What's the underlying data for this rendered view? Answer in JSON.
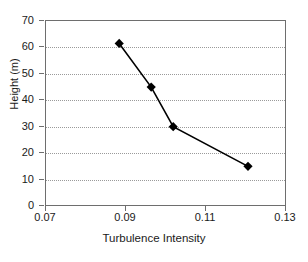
{
  "chart_data": {
    "type": "line",
    "title": "",
    "xlabel": "Turbulence Intensity",
    "ylabel": "Height (m)",
    "xlim": [
      0.07,
      0.13
    ],
    "ylim": [
      0,
      70
    ],
    "xticks": [
      0.07,
      0.09,
      0.11,
      0.13
    ],
    "xtick_labels": [
      "0.07",
      "0.09",
      "0.11",
      "0.13"
    ],
    "yticks": [
      0,
      10,
      20,
      30,
      40,
      50,
      60,
      70
    ],
    "ytick_labels": [
      "0",
      "10",
      "20",
      "30",
      "40",
      "50",
      "60",
      "70"
    ],
    "grid": "horizontal-dotted",
    "legend": "none",
    "marker": "filled-diamond",
    "marker_color": "#000000",
    "line_color": "#000000",
    "frame_color": "#6e6e6e",
    "gridline_color": "#9a9a9a",
    "background": "#ffffff",
    "series": [
      {
        "name": "Turbulence Intensity profile",
        "x": [
          0.0883,
          0.0963,
          0.1018,
          0.1205
        ],
        "y": [
          61.5,
          45,
          30,
          15
        ],
        "points": [
          {
            "x": 0.0883,
            "y": 61.5
          },
          {
            "x": 0.0963,
            "y": 45
          },
          {
            "x": 0.1018,
            "y": 30
          },
          {
            "x": 0.1205,
            "y": 15
          }
        ]
      }
    ]
  },
  "axes": {
    "y_title": "Height (m)",
    "x_title": "Turbulence Intensity"
  }
}
